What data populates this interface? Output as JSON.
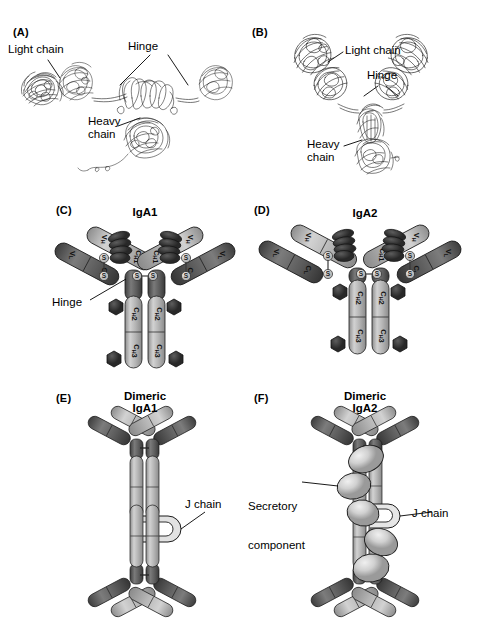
{
  "figure": {
    "background": "#ffffff",
    "panels": [
      {
        "id": "A",
        "label": "(A)",
        "type": "ribbon-structure",
        "title": "",
        "annotations": [
          {
            "name": "light-chain",
            "text": "Light chain"
          },
          {
            "name": "hinge",
            "text": "Hinge"
          },
          {
            "name": "heavy-chain",
            "text": "Heavy\nchain"
          }
        ]
      },
      {
        "id": "B",
        "label": "(B)",
        "type": "ribbon-structure",
        "title": "",
        "annotations": [
          {
            "name": "light-chain",
            "text": "Light chain"
          },
          {
            "name": "hinge",
            "text": "Hinge"
          },
          {
            "name": "heavy-chain",
            "text": "Heavy\nchain"
          }
        ]
      },
      {
        "id": "C",
        "label": "(C)",
        "type": "domain-schematic",
        "title": "IgA1",
        "annotations": [
          {
            "name": "hinge",
            "text": "Hinge"
          }
        ],
        "domains": {
          "light_chain": [
            "V",
            "C"
          ],
          "heavy_chain": [
            "V",
            "C",
            "C",
            "C"
          ]
        }
      },
      {
        "id": "D",
        "label": "(D)",
        "type": "domain-schematic",
        "title": "IgA2",
        "annotations": [],
        "domains": {
          "light_chain": [
            "V",
            "C"
          ],
          "heavy_chain": [
            "V",
            "C",
            "C",
            "C"
          ]
        }
      },
      {
        "id": "E",
        "label": "(E)",
        "type": "dimer-schematic",
        "title": "Dimeric\nIgA1",
        "title_line1": "Dimeric",
        "title_line2": "IgA1",
        "annotations": [
          {
            "name": "j-chain",
            "text": "J chain"
          }
        ]
      },
      {
        "id": "F",
        "label": "(F)",
        "type": "dimer-schematic",
        "title": "Dimeric\nIgA2",
        "title_line1": "Dimeric",
        "title_line2": "IgA2",
        "annotations": [
          {
            "name": "secretory-component",
            "text": "Secretory\ncomponent"
          },
          {
            "name": "secretory-component-l1",
            "text": "Secretory"
          },
          {
            "name": "secretory-component-l2",
            "text": "component"
          },
          {
            "name": "j-chain",
            "text": "J chain"
          }
        ]
      }
    ],
    "domain_labels": {
      "VL": {
        "base": "V",
        "sub": "L"
      },
      "CL": {
        "base": "C",
        "sub": "L"
      },
      "VH": {
        "base": "V",
        "sub": "H"
      },
      "CH1": {
        "base": "C",
        "sub": "H",
        "num": "1"
      },
      "CH2": {
        "base": "C",
        "sub": "H",
        "num": "2"
      },
      "CH3": {
        "base": "C",
        "sub": "H",
        "num": "3"
      }
    },
    "bond_label": "S",
    "bond_pair": "S-S",
    "colors": {
      "light_chain": "#5a5a5a",
      "light_chain_dark": "#3b3b3b",
      "heavy_chain": "#a8a8a8",
      "heavy_chain_light": "#c9c9c9",
      "hinge_dark": "#555555",
      "carbohydrate": "#3a3a3a",
      "j_chain": "#d8d8d8",
      "secretory_component": "#cfcfcf",
      "outline": "#000000",
      "background": "#ffffff"
    }
  }
}
